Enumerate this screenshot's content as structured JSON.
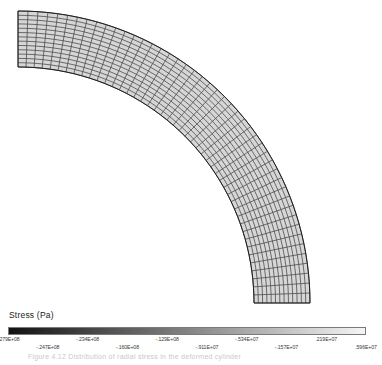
{
  "figure": {
    "type": "fea-contour-plot",
    "background": "#ffffff"
  },
  "legend": {
    "title": "Stress (Pa)",
    "colormap": "grayscale-dark-to-light",
    "colors": [
      "#111111",
      "#2e2e2e",
      "#4a4a4a",
      "#676767",
      "#838383",
      "#a0a0a0",
      "#bcbcbc",
      "#d9d9d9",
      "#f5f5f5"
    ],
    "ticks": [
      {
        "label": "-.279E+08",
        "row": "up"
      },
      {
        "label": "-.247E+08",
        "row": "dn"
      },
      {
        "label": "-.234E+08",
        "row": "up"
      },
      {
        "label": "-.160E+08",
        "row": "dn"
      },
      {
        "label": "-.129E+08",
        "row": "up"
      },
      {
        "label": "-.911E+07",
        "row": "dn"
      },
      {
        "label": "-.534E+07",
        "row": "up"
      },
      {
        "label": "-.157E+07",
        "row": "dn"
      },
      {
        "label": ".219E+07",
        "row": "up"
      },
      {
        "label": ".596E+07",
        "row": "dn"
      }
    ]
  },
  "caption": {
    "text": "Figure 4.12 Distribution of radial stress in the deformed cylinder"
  },
  "chart_data": {
    "type": "heatmap",
    "title": "Stress (Pa)",
    "xlabel": "",
    "ylabel": "",
    "colorbar_min": -27900000,
    "colorbar_max": 5960000,
    "colorbar_tick_values": [
      -27900000,
      -24700000,
      -23400000,
      -16000000,
      -12900000,
      -9110000,
      -5340000,
      -1570000,
      2190000,
      5960000
    ],
    "colorbar_tick_labels": [
      "-.279E+08",
      "-.247E+08",
      "-.234E+08",
      "-.160E+08",
      "-.129E+08",
      "-.911E+07",
      "-.534E+07",
      "-.157E+07",
      ".219E+07",
      ".596E+07"
    ],
    "legend_position": "bottom",
    "grid": false,
    "mesh": {
      "shape": "quarter-annulus",
      "elements_circumferential": 46,
      "elements_radial": 13,
      "element_type": "quadrilateral",
      "edge_color": "#3a3a3a",
      "fill_color": "#d6d6d6"
    }
  }
}
